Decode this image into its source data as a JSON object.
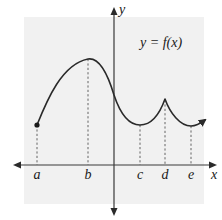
{
  "figure": {
    "background_color": "#f1f1f1",
    "curve_label": "y = f(x)",
    "axes": {
      "x_label": "x",
      "y_label": "y"
    },
    "x_ticks": [
      {
        "label": "a",
        "px": 37
      },
      {
        "label": "b",
        "px": 88
      },
      {
        "label": "c",
        "px": 140
      },
      {
        "label": "d",
        "px": 165
      },
      {
        "label": "e",
        "px": 191
      }
    ],
    "features": [
      {
        "point": "a",
        "type": "closed endpoint"
      },
      {
        "point": "b",
        "type": "local maximum (smooth)"
      },
      {
        "point": "c",
        "type": "local minimum (smooth)"
      },
      {
        "point": "d",
        "type": "local maximum (cusp, not differentiable)"
      },
      {
        "point": "e",
        "type": "local minimum (smooth)"
      }
    ],
    "curve_end": "arrow (continues to the right)"
  }
}
